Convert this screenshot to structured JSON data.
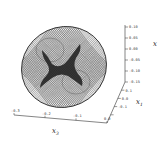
{
  "chart_data": {
    "type": "surface3d",
    "title": "",
    "axes": {
      "x": {
        "label": "x3",
        "ticks": [
          "-0.3",
          "-0.2",
          "-0.1",
          "0.0"
        ]
      },
      "y": {
        "label": "x1",
        "ticks": [
          "0.1",
          "0.0",
          "-0.1",
          ""
        ]
      },
      "z": {
        "label": "x2",
        "ticks": [
          "0.10",
          "0.05",
          "0.00",
          "-0.05",
          "-0.10",
          "-0.15"
        ]
      }
    },
    "grid": false,
    "mesh_color": "#1a1a1a",
    "background": "#ffffff"
  },
  "labels": {
    "x_axis": "x",
    "x_axis_sub": "3",
    "y_axis": "x",
    "y_axis_sub": "1",
    "z_axis": "x"
  }
}
